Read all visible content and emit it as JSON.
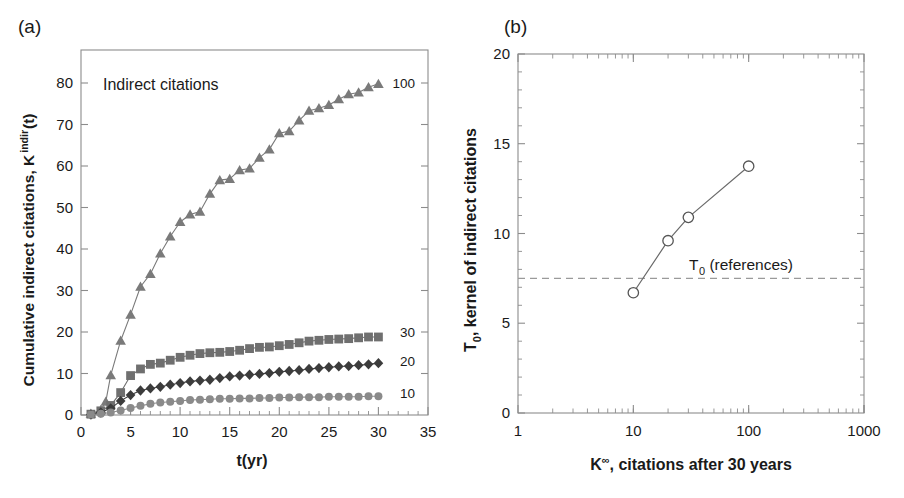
{
  "figure": {
    "panel_a_label": "(a)",
    "panel_b_label": "(b)"
  },
  "panel_a": {
    "annotation": "Indirect citations",
    "xlabel": "t(yr)",
    "ylabel_main": "Cumulative indirect citations, K",
    "ylabel_sup": "indir",
    "ylabel_tail": "(t)",
    "xticks": [
      "0",
      "5",
      "10",
      "15",
      "20",
      "25",
      "30",
      "35"
    ],
    "yticks": [
      "0",
      "10",
      "20",
      "30",
      "40",
      "50",
      "60",
      "70",
      "80"
    ],
    "series_labels": [
      "100",
      "30",
      "20",
      "10"
    ]
  },
  "panel_b": {
    "xlabel_main": "K",
    "xlabel_sup": "∞",
    "xlabel_tail": ", citations after 30 years",
    "ylabel_main": "T",
    "ylabel_sub": "0",
    "ylabel_tail": ", kernel of indirect citations",
    "xticks": [
      "1",
      "10",
      "100",
      "1000"
    ],
    "yticks": [
      "0",
      "5",
      "10",
      "15",
      "20"
    ],
    "annotation_main": "T",
    "annotation_sub": "0",
    "annotation_tail": " (references)",
    "reference_line_value": 7.5
  },
  "colors": {
    "triangle": "#7a7a7a",
    "square": "#6f6f6f",
    "diamond": "#3c3c3c",
    "circle": "#8a8a8a",
    "open_circle_stroke": "#555555",
    "axis": "#8c8c8c",
    "text": "#1a1a1a",
    "dashed": "#9a9a9a"
  },
  "chart_data": [
    {
      "type": "line",
      "panel": "a",
      "title": "Indirect citations",
      "xlabel": "t(yr)",
      "ylabel": "Cumulative indirect citations, K^indir(t)",
      "xlim": [
        0,
        35
      ],
      "ylim": [
        0,
        84
      ],
      "grid": false,
      "legend": "right-edge series labels",
      "series": [
        {
          "name": "100",
          "marker": "triangle",
          "x": [
            1,
            2,
            2.5,
            3,
            4,
            5,
            6,
            7,
            8,
            9,
            10,
            11,
            12,
            13,
            14,
            15,
            16,
            17,
            18,
            19,
            20,
            21,
            22,
            23,
            24,
            25,
            26,
            27,
            28,
            29,
            30
          ],
          "y": [
            0.3,
            1.2,
            3.2,
            9.6,
            17.9,
            24.2,
            30.9,
            34.0,
            38.9,
            43.0,
            46.5,
            48.3,
            49.0,
            53.3,
            56.6,
            56.9,
            59.0,
            59.4,
            62.0,
            64.0,
            67.9,
            68.4,
            71.0,
            73.3,
            73.9,
            74.7,
            76.1,
            77.3,
            77.7,
            79.0,
            79.8
          ]
        },
        {
          "name": "30",
          "marker": "square",
          "x": [
            1,
            2,
            3,
            4,
            5,
            6,
            7,
            8,
            9,
            10,
            11,
            12,
            13,
            14,
            15,
            16,
            17,
            18,
            19,
            20,
            21,
            22,
            23,
            24,
            25,
            26,
            27,
            28,
            29,
            30
          ],
          "y": [
            0.2,
            1.0,
            2.3,
            5.4,
            9.5,
            11.1,
            12.2,
            12.5,
            13.2,
            13.9,
            14.4,
            14.8,
            15.0,
            15.1,
            15.3,
            15.6,
            16.0,
            16.3,
            16.4,
            16.7,
            17.0,
            17.4,
            17.8,
            18.0,
            18.2,
            18.3,
            18.4,
            18.6,
            18.8,
            18.8
          ]
        },
        {
          "name": "20",
          "marker": "diamond",
          "x": [
            1,
            2,
            3,
            4,
            5,
            6,
            7,
            8,
            9,
            10,
            11,
            12,
            13,
            14,
            15,
            16,
            17,
            18,
            19,
            20,
            21,
            22,
            23,
            24,
            25,
            26,
            27,
            28,
            29,
            30
          ],
          "y": [
            0.1,
            0.6,
            1.6,
            3.4,
            4.8,
            5.9,
            6.4,
            6.8,
            7.3,
            7.7,
            8.1,
            8.3,
            8.5,
            8.9,
            9.3,
            9.5,
            9.7,
            9.9,
            10.1,
            10.4,
            10.6,
            10.8,
            11.1,
            11.3,
            11.5,
            11.7,
            11.8,
            12.0,
            12.2,
            12.5
          ]
        },
        {
          "name": "10",
          "marker": "circle",
          "x": [
            1,
            2,
            3,
            4,
            5,
            6,
            7,
            8,
            9,
            10,
            11,
            12,
            13,
            14,
            15,
            16,
            17,
            18,
            19,
            20,
            21,
            22,
            23,
            24,
            25,
            26,
            27,
            28,
            29,
            30
          ],
          "y": [
            0.1,
            0.3,
            0.6,
            1.1,
            1.7,
            2.2,
            2.7,
            3.0,
            3.2,
            3.4,
            3.6,
            3.7,
            3.8,
            3.9,
            3.9,
            4.0,
            4.0,
            4.1,
            4.1,
            4.2,
            4.2,
            4.3,
            4.3,
            4.3,
            4.4,
            4.4,
            4.4,
            4.4,
            4.5,
            4.5
          ]
        }
      ]
    },
    {
      "type": "line",
      "panel": "b",
      "title": "",
      "xlabel": "K∞, citations after 30 years",
      "ylabel": "T0, kernel of indirect citations",
      "xscale": "log",
      "xlim": [
        1,
        1000
      ],
      "ylim": [
        0,
        20
      ],
      "grid": false,
      "marker": "open-circle",
      "x": [
        10,
        20,
        30,
        100
      ],
      "y": [
        6.7,
        9.6,
        10.9,
        13.75
      ],
      "annotations": [
        {
          "text": "T0 (references)",
          "type": "dashed-hline",
          "value": 7.5
        }
      ]
    }
  ]
}
